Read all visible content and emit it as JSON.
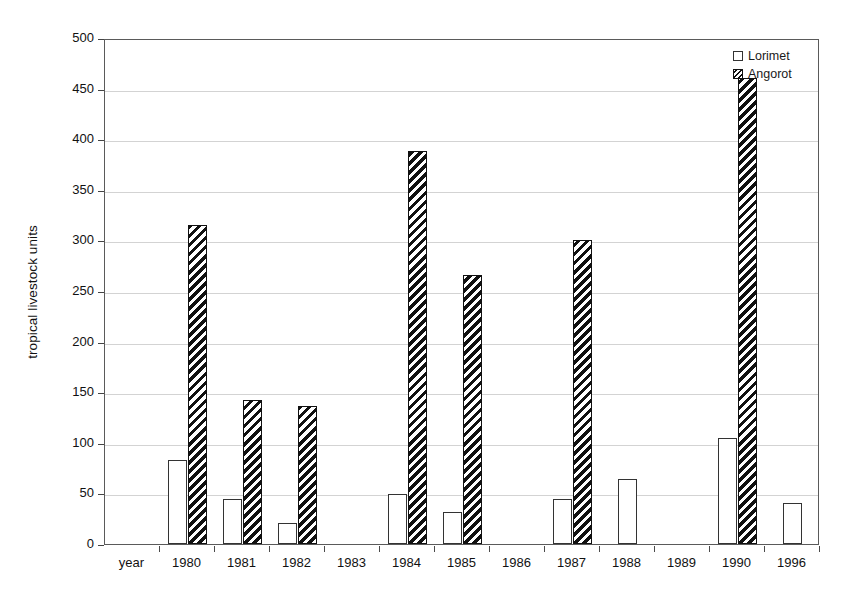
{
  "chart_data": {
    "type": "bar",
    "title": "",
    "xlabel": "",
    "ylabel": "tropical livestock units",
    "ylim": [
      0,
      500
    ],
    "yticks": [
      0,
      50,
      100,
      150,
      200,
      250,
      300,
      350,
      400,
      450,
      500
    ],
    "grid": true,
    "legend_position": "top-right",
    "categories": [
      "year",
      "1980",
      "1981",
      "1982",
      "1983",
      "1984",
      "1985",
      "1986",
      "1987",
      "1988",
      "1989",
      "1990",
      "1996"
    ],
    "series": [
      {
        "name": "Lorimet",
        "style": "hollow",
        "values": [
          null,
          83,
          44,
          21,
          null,
          49,
          32,
          null,
          44,
          64,
          null,
          105,
          41
        ]
      },
      {
        "name": "Angorot",
        "style": "hatched",
        "values": [
          null,
          315,
          142,
          136,
          null,
          388,
          266,
          null,
          300,
          null,
          null,
          460,
          null
        ]
      }
    ]
  },
  "legend": {
    "items": [
      {
        "label": "Lorimet",
        "marker": "hollow-square-icon"
      },
      {
        "label": "Angorot",
        "marker": "hatched-square-icon"
      }
    ]
  },
  "axis": {
    "y_title": "tropical livestock units",
    "y_tick_labels": [
      "500",
      "450",
      "400",
      "350",
      "300",
      "250",
      "200",
      "150",
      "100",
      "50",
      "0"
    ],
    "x_tick_labels": [
      "year",
      "1980",
      "1981",
      "1982",
      "1983",
      "1984",
      "1985",
      "1986",
      "1987",
      "1988",
      "1989",
      "1990",
      "1996"
    ]
  },
  "colors": {
    "bar_outline": "#333333",
    "hatch_dark": "#111111",
    "hatch_light": "#ffffff",
    "gridline": "#d3d3d3",
    "frame": "#5a5a5a",
    "text": "#111111",
    "background": "#ffffff"
  }
}
